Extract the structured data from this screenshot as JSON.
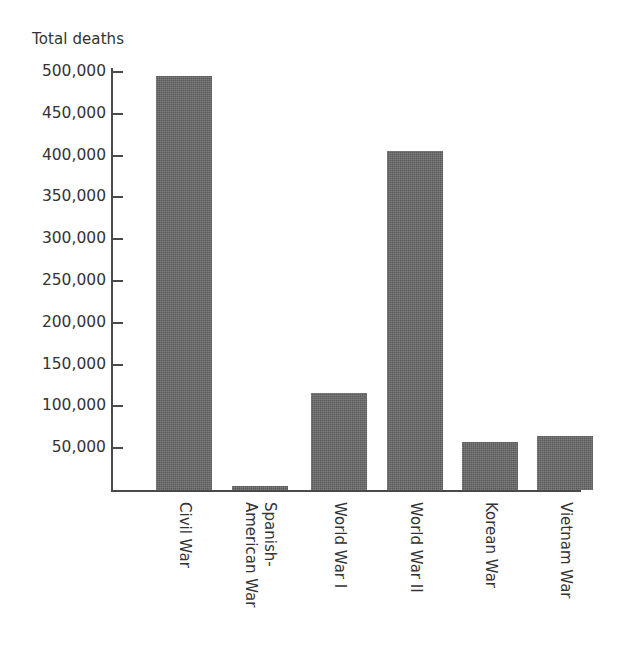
{
  "chart_data": {
    "type": "bar",
    "title": "",
    "ylabel": "Total deaths",
    "xlabel": "",
    "categories": [
      "Civil War",
      "Spanish-American War",
      "World War I",
      "World War II",
      "Korean War",
      "Vietnam War"
    ],
    "category_lines": [
      [
        "Civil War"
      ],
      [
        "Spanish-",
        "American War"
      ],
      [
        "World War I"
      ],
      [
        "World War II"
      ],
      [
        "Korean War"
      ],
      [
        "Vietnam War"
      ]
    ],
    "values": [
      495000,
      5000,
      116000,
      405000,
      58000,
      65000
    ],
    "ylim": [
      0,
      520000
    ],
    "yticks": [
      50000,
      100000,
      150000,
      200000,
      250000,
      300000,
      350000,
      400000,
      450000,
      500000
    ],
    "ytick_labels": [
      "50,000",
      "100,000",
      "150,000",
      "200,000",
      "250,000",
      "300,000",
      "350,000",
      "400,000",
      "450,000",
      "500,000"
    ],
    "grid": false,
    "legend": null,
    "bar_color": "#5c5c5c",
    "axis_color": "#4a4a4a",
    "background": "#ffffff"
  },
  "axis": {
    "y_title": "Total deaths"
  }
}
